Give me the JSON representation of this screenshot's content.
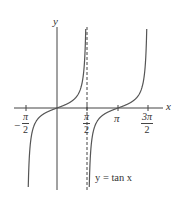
{
  "chart_data": {
    "type": "line",
    "title": "",
    "function": "y = tan x",
    "xlabel": "x",
    "ylabel": "y",
    "x_ticks": [
      {
        "value": -1.5708,
        "label_num": "π",
        "label_den": "2",
        "sign": "−"
      },
      {
        "value": 1.5708,
        "label_num": "π",
        "label_den": "2",
        "sign": ""
      },
      {
        "value": 3.1416,
        "label": "π"
      },
      {
        "value": 4.7124,
        "label_num": "3π",
        "label_den": "2",
        "sign": ""
      }
    ],
    "asymptotes": [
      {
        "x": 1.5708,
        "style": "dashed"
      }
    ],
    "series": [
      {
        "name": "tan x branch 1",
        "domain": [
          -1.48,
          1.48
        ]
      },
      {
        "name": "tan x branch 2",
        "domain": [
          1.66,
          4.62
        ]
      }
    ],
    "annotation": "y = tan x",
    "grid": false,
    "legend": "none"
  },
  "labels": {
    "y_axis": "y",
    "x_axis": "x",
    "pi": "π",
    "neg": "−",
    "pi_num": "π",
    "three_pi_num": "3π",
    "two": "2",
    "curve_label": "y = tan x"
  },
  "colors": {
    "axis": "#444444",
    "curve": "#555555",
    "text": "#333333"
  }
}
